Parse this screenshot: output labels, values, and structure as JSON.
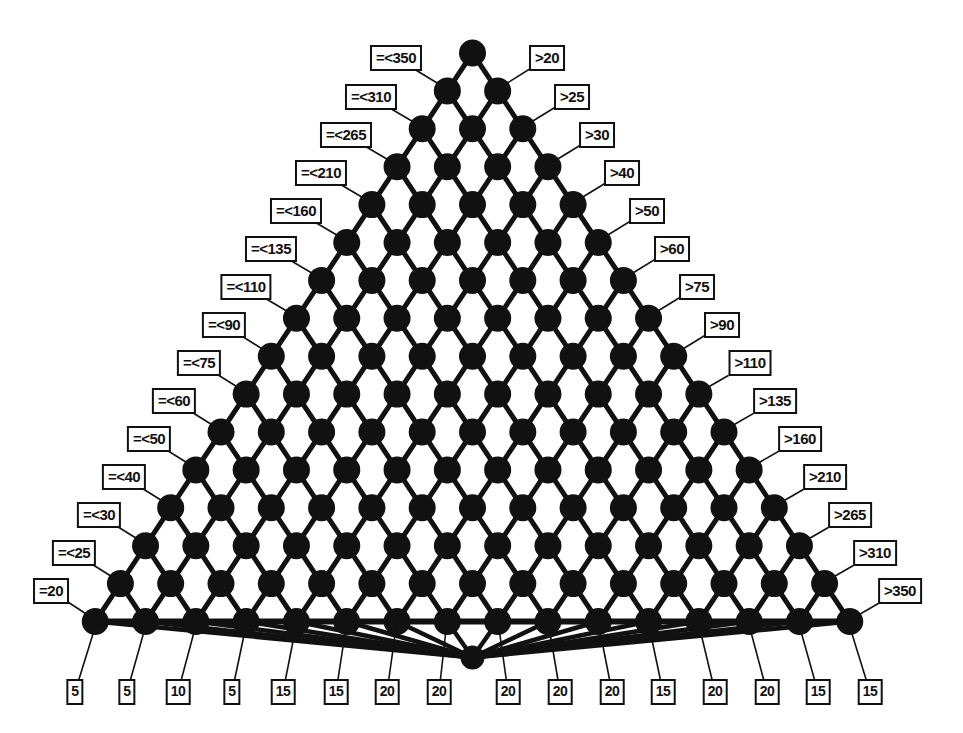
{
  "figure": {
    "kind": "triangular-lattice-diagram",
    "node_color": "#111111",
    "edge_color": "#111111",
    "background": "#ffffff",
    "label_border_color": "#111111",
    "label_text_color": "#111111"
  },
  "chart_data": {
    "type": "diagram",
    "title": "",
    "xlabel": "",
    "ylabel": "",
    "left_labels": [
      "=<350",
      "=<310",
      "=<265",
      "=<210",
      "=<160",
      "=<135",
      "=<110",
      "=<90",
      "=<75",
      "=<60",
      "=<50",
      "=<40",
      "=<30",
      "=<25",
      "=20"
    ],
    "right_labels": [
      ">20",
      ">25",
      ">30",
      ">40",
      ">50",
      ">60",
      ">75",
      ">90",
      ">110",
      ">135",
      ">160",
      ">210",
      ">265",
      ">310",
      ">350"
    ],
    "bottom_labels": [
      "5",
      "5",
      "10",
      "5",
      "15",
      "15",
      "20",
      "20",
      "20",
      "20",
      "20",
      "15",
      "20",
      "20",
      "15",
      "15"
    ],
    "rows": 16,
    "apex_nodes": 1,
    "base_nodes": 17,
    "hub_node": true
  },
  "left_callouts": [
    {
      "text": "=<350",
      "lx": 396,
      "ly": 58,
      "nx": 447,
      "ny": 89
    },
    {
      "text": "=<310",
      "lx": 371,
      "ly": 97,
      "nx": 422,
      "ny": 127
    },
    {
      "text": "=<265",
      "lx": 346,
      "ly": 135,
      "nx": 397,
      "ny": 165
    },
    {
      "text": "=<210",
      "lx": 321,
      "ly": 173,
      "nx": 372,
      "ny": 203
    },
    {
      "text": "=<160",
      "lx": 296,
      "ly": 211,
      "nx": 347,
      "ny": 241
    },
    {
      "text": "=<135",
      "lx": 271,
      "ly": 249,
      "nx": 322,
      "ny": 279
    },
    {
      "text": "=<110",
      "lx": 246,
      "ly": 287,
      "nx": 297,
      "ny": 317
    },
    {
      "text": "=<90",
      "lx": 224,
      "ly": 325,
      "nx": 272,
      "ny": 355
    },
    {
      "text": "=<75",
      "lx": 199,
      "ly": 363,
      "nx": 247,
      "ny": 393
    },
    {
      "text": "=<60",
      "lx": 174,
      "ly": 401,
      "nx": 222,
      "ny": 431
    },
    {
      "text": "=<50",
      "lx": 149,
      "ly": 439,
      "nx": 197,
      "ny": 469
    },
    {
      "text": "=<40",
      "lx": 124,
      "ly": 477,
      "nx": 172,
      "ny": 507
    },
    {
      "text": "=<30",
      "lx": 99,
      "ly": 515,
      "nx": 147,
      "ny": 545
    },
    {
      "text": "=<25",
      "lx": 74,
      "ly": 553,
      "nx": 122,
      "ny": 583
    },
    {
      "text": "=20",
      "lx": 51,
      "ly": 591,
      "nx": 97,
      "ny": 621
    }
  ],
  "right_callouts": [
    {
      "text": ">20",
      "lx": 547,
      "ly": 58,
      "nx": 498,
      "ny": 89
    },
    {
      "text": ">25",
      "lx": 572,
      "ly": 97,
      "nx": 523,
      "ny": 127
    },
    {
      "text": ">30",
      "lx": 597,
      "ly": 135,
      "nx": 548,
      "ny": 165
    },
    {
      "text": ">40",
      "lx": 622,
      "ly": 173,
      "nx": 573,
      "ny": 203
    },
    {
      "text": ">50",
      "lx": 647,
      "ly": 211,
      "nx": 598,
      "ny": 241
    },
    {
      "text": ">60",
      "lx": 672,
      "ly": 249,
      "nx": 623,
      "ny": 279
    },
    {
      "text": ">75",
      "lx": 697,
      "ly": 287,
      "nx": 648,
      "ny": 317
    },
    {
      "text": ">90",
      "lx": 722,
      "ly": 325,
      "nx": 673,
      "ny": 355
    },
    {
      "text": ">110",
      "lx": 750,
      "ly": 363,
      "nx": 698,
      "ny": 393
    },
    {
      "text": ">135",
      "lx": 775,
      "ly": 401,
      "nx": 723,
      "ny": 431
    },
    {
      "text": ">160",
      "lx": 800,
      "ly": 439,
      "nx": 748,
      "ny": 469
    },
    {
      "text": ">210",
      "lx": 825,
      "ly": 477,
      "nx": 773,
      "ny": 507
    },
    {
      "text": ">265",
      "lx": 850,
      "ly": 515,
      "nx": 798,
      "ny": 545
    },
    {
      "text": ">310",
      "lx": 875,
      "ly": 553,
      "nx": 823,
      "ny": 583
    },
    {
      "text": ">350",
      "lx": 900,
      "ly": 591,
      "nx": 848,
      "ny": 621
    }
  ],
  "bottom_callouts": [
    {
      "text": "5",
      "lx": 75,
      "ly": 692,
      "nx": 97,
      "ny": 621
    },
    {
      "text": "5",
      "lx": 127,
      "ly": 692,
      "nx": 147,
      "ny": 621
    },
    {
      "text": "10",
      "lx": 178,
      "ly": 692,
      "nx": 197,
      "ny": 621
    },
    {
      "text": "5",
      "lx": 232,
      "ly": 692,
      "nx": 247,
      "ny": 621
    },
    {
      "text": "15",
      "lx": 283,
      "ly": 692,
      "nx": 297,
      "ny": 621
    },
    {
      "text": "15",
      "lx": 336,
      "ly": 692,
      "nx": 347,
      "ny": 621
    },
    {
      "text": "20",
      "lx": 387,
      "ly": 692,
      "nx": 397,
      "ny": 621
    },
    {
      "text": "20",
      "lx": 439,
      "ly": 692,
      "nx": 447,
      "ny": 621
    },
    {
      "text": "20",
      "lx": 508,
      "ly": 692,
      "nx": 498,
      "ny": 621
    },
    {
      "text": "20",
      "lx": 560,
      "ly": 692,
      "nx": 548,
      "ny": 621
    },
    {
      "text": "20",
      "lx": 612,
      "ly": 692,
      "nx": 598,
      "ny": 621
    },
    {
      "text": "15",
      "lx": 663,
      "ly": 692,
      "nx": 648,
      "ny": 621
    },
    {
      "text": "20",
      "lx": 715,
      "ly": 692,
      "nx": 698,
      "ny": 621
    },
    {
      "text": "20",
      "lx": 767,
      "ly": 692,
      "nx": 748,
      "ny": 621
    },
    {
      "text": "15",
      "lx": 818,
      "ly": 692,
      "nx": 798,
      "ny": 621
    },
    {
      "text": "15",
      "lx": 870,
      "ly": 692,
      "nx": 848,
      "ny": 621
    }
  ]
}
